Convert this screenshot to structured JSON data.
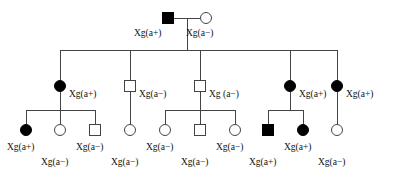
{
  "figure": {
    "type": "pedigree-chart",
    "trait": "Xg blood group",
    "colors": {
      "affected_fill": "#000000",
      "unaffected_fill": "#ffffff",
      "stroke": "#444444",
      "text": "#111111",
      "background": "#ffffff"
    },
    "symbol_legend": {
      "square": "male",
      "circle": "female",
      "filled": "Xg(a+) affected / positive",
      "open": "Xg(a-) unaffected / negative"
    }
  },
  "generations": [
    {
      "id": "generation-1",
      "individuals": [
        {
          "id": "I-1",
          "shape": "square",
          "filled": true,
          "sex": "male",
          "label": "Xg(a+)",
          "cx": 168,
          "cy": 18,
          "size": 11,
          "label_x": 134,
          "label_y": 29
        },
        {
          "id": "I-2",
          "shape": "circle",
          "filled": false,
          "sex": "female",
          "label": "Xg(a−)",
          "cx": 206,
          "cy": 18,
          "size": 11,
          "label_x": 186,
          "label_y": 29
        }
      ]
    },
    {
      "id": "generation-2",
      "individuals": [
        {
          "id": "II-1",
          "shape": "circle",
          "filled": true,
          "sex": "female",
          "label": "Xg(a+)",
          "cx": 60,
          "cy": 86,
          "size": 11,
          "label_x": 69,
          "label_y": 90
        },
        {
          "id": "II-2",
          "shape": "square",
          "filled": false,
          "sex": "male",
          "label": "Xg(a−)",
          "cx": 130,
          "cy": 86,
          "size": 11,
          "label_x": 139,
          "label_y": 90
        },
        {
          "id": "II-3",
          "shape": "square",
          "filled": false,
          "sex": "male",
          "label": "Xg (a−)",
          "cx": 200,
          "cy": 86,
          "size": 11,
          "label_x": 209,
          "label_y": 90
        },
        {
          "id": "II-4",
          "shape": "circle",
          "filled": true,
          "sex": "female",
          "label": "Xg(a+)",
          "cx": 290,
          "cy": 86,
          "size": 11,
          "label_x": 299,
          "label_y": 90
        },
        {
          "id": "II-5",
          "shape": "circle",
          "filled": true,
          "sex": "female",
          "label": "Xg(a+)",
          "cx": 337,
          "cy": 86,
          "size": 11,
          "label_x": 346,
          "label_y": 90
        }
      ]
    },
    {
      "id": "generation-3",
      "individuals": [
        {
          "id": "III-1",
          "shape": "circle",
          "filled": true,
          "sex": "female",
          "label": "Xg(a+)",
          "cx": 26,
          "cy": 130,
          "size": 11,
          "label_x": 7,
          "label_y": 143
        },
        {
          "id": "III-2",
          "shape": "circle",
          "filled": false,
          "sex": "female",
          "label": "Xg(a−)",
          "cx": 60,
          "cy": 130,
          "size": 11,
          "label_x": 41,
          "label_y": 158
        },
        {
          "id": "III-3",
          "shape": "square",
          "filled": false,
          "sex": "male",
          "label": "Xg(a−)",
          "cx": 95,
          "cy": 130,
          "size": 11,
          "label_x": 76,
          "label_y": 143
        },
        {
          "id": "III-4",
          "shape": "circle",
          "filled": false,
          "sex": "female",
          "label": "Xg(a−)",
          "cx": 130,
          "cy": 130,
          "size": 11,
          "label_x": 111,
          "label_y": 158
        },
        {
          "id": "III-5",
          "shape": "circle",
          "filled": false,
          "sex": "female",
          "label": "Xg(a−)",
          "cx": 165,
          "cy": 130,
          "size": 11,
          "label_x": 146,
          "label_y": 143
        },
        {
          "id": "III-6",
          "shape": "square",
          "filled": false,
          "sex": "male",
          "label": "Xg(a−)",
          "cx": 200,
          "cy": 130,
          "size": 11,
          "label_x": 181,
          "label_y": 158
        },
        {
          "id": "III-7",
          "shape": "circle",
          "filled": false,
          "sex": "female",
          "label": "Xg(a−)",
          "cx": 235,
          "cy": 130,
          "size": 11,
          "label_x": 216,
          "label_y": 143
        },
        {
          "id": "III-8",
          "shape": "square",
          "filled": true,
          "sex": "male",
          "label": "Xg(a+)",
          "cx": 268,
          "cy": 130,
          "size": 11,
          "label_x": 249,
          "label_y": 158
        },
        {
          "id": "III-9",
          "shape": "circle",
          "filled": true,
          "sex": "female",
          "label": "Xg(a+)",
          "cx": 303,
          "cy": 130,
          "size": 11,
          "label_x": 284,
          "label_y": 143
        },
        {
          "id": "III-10",
          "shape": "circle",
          "filled": false,
          "sex": "female",
          "label": "Xg(a−)",
          "cx": 337,
          "cy": 130,
          "size": 11,
          "label_x": 318,
          "label_y": 158
        }
      ]
    }
  ],
  "connections": {
    "mating_line_gen1": {
      "x1": 174,
      "y1": 18,
      "x2": 200,
      "y2": 18
    },
    "descent_drop_gen1": {
      "x": 187,
      "y1": 18,
      "y2": 50
    },
    "sibship_line_gen2": {
      "x1": 60,
      "y": 50,
      "x2": 337
    },
    "sibship_drops_gen2": [
      60,
      130,
      200,
      290,
      337
    ],
    "sibship_groups_gen3": [
      {
        "parent_x": 60,
        "drop_from_y": 92,
        "bar_y": 110,
        "bar_x1": 26,
        "bar_x2": 95,
        "children_x": [
          26,
          60,
          95
        ]
      },
      {
        "parent_x": 130,
        "drop_from_y": 92,
        "bar_y": 110,
        "bar_x1": 130,
        "bar_x2": 130,
        "children_x": [
          130
        ]
      },
      {
        "parent_x": 200,
        "drop_from_y": 92,
        "bar_y": 110,
        "bar_x1": 165,
        "bar_x2": 235,
        "children_x": [
          165,
          200,
          235
        ]
      },
      {
        "parent_x": 290,
        "drop_from_y": 92,
        "bar_y": 110,
        "bar_x1": 268,
        "bar_x2": 303,
        "children_x": [
          268,
          303
        ]
      },
      {
        "parent_x": 337,
        "drop_from_y": 92,
        "bar_y": 110,
        "bar_x1": 337,
        "bar_x2": 337,
        "children_x": [
          337
        ]
      }
    ]
  }
}
